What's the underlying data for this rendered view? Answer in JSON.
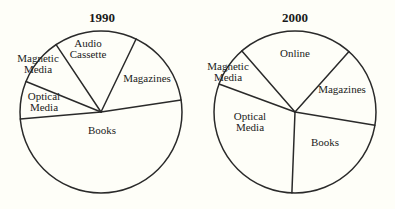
{
  "chart_data": [
    {
      "type": "pie",
      "title": "1990",
      "center": [
        101,
        112
      ],
      "radius": 81,
      "start_angle_deg": -33.7,
      "slices": [
        {
          "label": "Audio Cassette",
          "value": 16.5,
          "label_lines": [
            "Audio",
            "Cassette"
          ],
          "label_pos": [
            88,
            47
          ]
        },
        {
          "label": "Magazines",
          "value": 15.5,
          "label_lines": [
            "Magazines"
          ],
          "label_pos": [
            147,
            82
          ]
        },
        {
          "label": "Books",
          "value": 51,
          "label_lines": [
            "Books"
          ],
          "label_pos": [
            102,
            134
          ]
        },
        {
          "label": "Optical Media",
          "value": 7.5,
          "label_lines": [
            "Optical",
            "Media"
          ],
          "label_pos": [
            44,
            100
          ]
        },
        {
          "label": "Magnetic Media",
          "value": 9.5,
          "label_lines": [
            "Magnetic",
            "Media"
          ],
          "label_pos": [
            38,
            62
          ]
        }
      ]
    },
    {
      "type": "pie",
      "title": "2000",
      "center": [
        295,
        112
      ],
      "radius": 81,
      "start_angle_deg": -41,
      "slices": [
        {
          "label": "Online",
          "value": 23,
          "label_lines": [
            "Online"
          ],
          "label_pos": [
            295,
            57
          ]
        },
        {
          "label": "Magazines",
          "value": 16,
          "label_lines": [
            "Magazines"
          ],
          "label_pos": [
            342,
            93
          ]
        },
        {
          "label": "Books",
          "value": 23,
          "label_lines": [
            "Books"
          ],
          "label_pos": [
            325,
            146
          ]
        },
        {
          "label": "Optical Media",
          "value": 30,
          "label_lines": [
            "Optical",
            "Media"
          ],
          "label_pos": [
            250,
            120
          ]
        },
        {
          "label": "Magnetic Media",
          "value": 8,
          "label_lines": [
            "Magnetic",
            "Media"
          ],
          "label_pos": [
            228,
            70
          ]
        }
      ]
    }
  ],
  "charts": {
    "left": {
      "title": "1990"
    },
    "right": {
      "title": "2000"
    }
  }
}
